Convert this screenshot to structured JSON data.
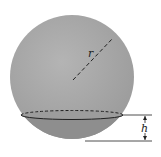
{
  "diagram": {
    "labels": {
      "radius": "r",
      "height": "h"
    },
    "colors": {
      "sphere": "#a8a8a8",
      "cap": "#8c8c8c",
      "cap_top": "#9a9a9a",
      "lines": "#222222",
      "background": "#ffffff"
    }
  }
}
